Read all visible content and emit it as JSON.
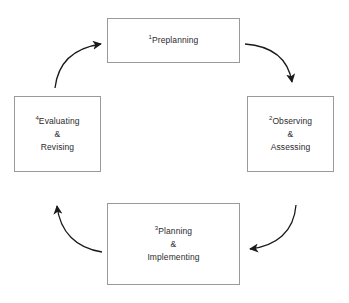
{
  "diagram": {
    "type": "cycle",
    "direction": "clockwise",
    "stroke_color": "#9a9a9a",
    "arrow_color": "#1a1a1a",
    "text_color": "#2b2b2b",
    "background": "#ffffff",
    "nodes": [
      {
        "id": "preplanning",
        "number": "1",
        "label": "Preplanning",
        "position": "top"
      },
      {
        "id": "observing",
        "number": "2",
        "label": "Observing\n&\nAssessing",
        "position": "right"
      },
      {
        "id": "planning",
        "number": "3",
        "label": "Planning\n&\nImplementing",
        "position": "bottom"
      },
      {
        "id": "evaluating",
        "number": "4",
        "label": "Evaluating\n&\nRevising",
        "position": "left"
      }
    ],
    "edges": [
      {
        "id": "edge-preplanning-observing",
        "from": "preplanning",
        "to": "observing"
      },
      {
        "id": "edge-observing-planning",
        "from": "observing",
        "to": "planning"
      },
      {
        "id": "edge-planning-evaluating",
        "from": "planning",
        "to": "evaluating"
      },
      {
        "id": "edge-evaluating-preplanning",
        "from": "evaluating",
        "to": "preplanning"
      }
    ]
  }
}
